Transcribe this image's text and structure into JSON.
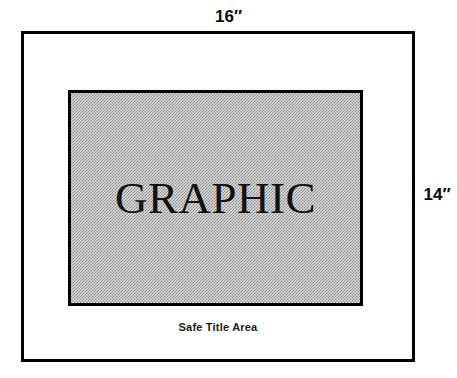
{
  "diagram": {
    "outer_frame": {
      "name": "safe-title-area-frame",
      "caption": "Safe Title Area",
      "width_label": "16″",
      "height_label": "14″"
    },
    "graphic_area": {
      "name": "graphic-area",
      "label": "GRAPHIC",
      "width_label": "12″",
      "height_label": "9″",
      "fill": "50% dot screen / halftone gray"
    },
    "colors": {
      "background": "#ffffff",
      "line": "#000000",
      "graphic_fill_light": "#d9d9d9",
      "graphic_fill_dark": "#8f8f8f",
      "text": "#111111"
    }
  },
  "chart_data": {
    "type": "diagram",
    "units": "inches",
    "elements": [
      {
        "name": "outer board",
        "label": "Safe Title Area",
        "width": 16,
        "height": 14,
        "width_label": "16″",
        "height_label": "14″"
      },
      {
        "name": "graphic area",
        "label": "GRAPHIC",
        "width": 12,
        "height": 9,
        "width_label": "12″",
        "height_label": "9″"
      }
    ],
    "annotations": [
      "16″",
      "12″",
      "9″",
      "14″",
      "GRAPHIC",
      "Safe Title Area"
    ]
  }
}
